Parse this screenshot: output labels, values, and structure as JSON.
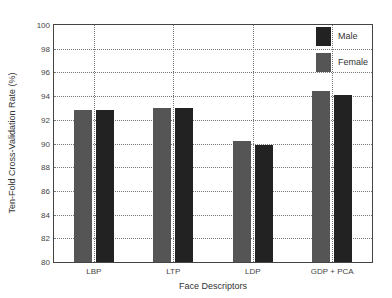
{
  "chart_data": {
    "type": "bar",
    "title": "",
    "xlabel": "Face Descriptors",
    "ylabel": "Ten-Fold Cross-Validation Rate (%)",
    "ylim": [
      80,
      100
    ],
    "yticks": [
      80,
      82,
      84,
      86,
      88,
      90,
      92,
      94,
      96,
      98,
      100
    ],
    "grid": true,
    "legend_position": "upper right",
    "categories": [
      "LBP",
      "LTP",
      "LDP",
      "GDP + PCA"
    ],
    "series": [
      {
        "name": "Female",
        "color": "#555555",
        "values": [
          92.8,
          93.0,
          90.2,
          94.4
        ]
      },
      {
        "name": "Male",
        "color": "#222222",
        "values": [
          92.8,
          93.0,
          89.9,
          94.1
        ]
      }
    ]
  },
  "legend": {
    "male": "Male",
    "female": "Female"
  },
  "labels": {
    "xlabel": "Face Descriptors",
    "ylabel": "Ten-Fold Cross-Validation Rate (%)"
  },
  "yticks": [
    "80",
    "82",
    "84",
    "86",
    "88",
    "90",
    "92",
    "94",
    "96",
    "98",
    "100"
  ],
  "xticks": [
    "LBP",
    "LTP",
    "LDP",
    "GDP + PCA"
  ]
}
